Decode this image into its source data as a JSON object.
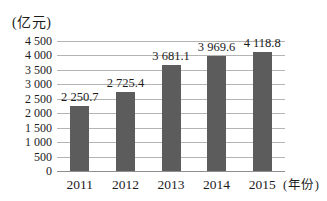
{
  "chart_data": {
    "type": "bar",
    "title": "",
    "unit_label": "(亿元)",
    "x_axis_label": "(年份)",
    "categories": [
      "2011",
      "2012",
      "2013",
      "2014",
      "2015"
    ],
    "values": [
      2250.7,
      2725.4,
      3681.1,
      3969.6,
      4118.8
    ],
    "value_labels": [
      "2 250.7",
      "2 725.4",
      "3 681.1",
      "3 969.6",
      "4 118.8"
    ],
    "y_ticks": [
      0,
      500,
      1000,
      1500,
      2000,
      2500,
      3000,
      3500,
      4000,
      4500
    ],
    "y_tick_labels": [
      "0",
      "500",
      "1 000",
      "1 500",
      "2 000",
      "2 500",
      "3 000",
      "3 500",
      "4 000",
      "4 500"
    ],
    "ylim": [
      0,
      4500
    ],
    "grid": true,
    "legend": "none",
    "bar_color": "#5c5c5c",
    "gridline_color": "#b4b4b4",
    "axis_color": "#8f8f8f",
    "text_color": "#1c1c1c",
    "background_color": "#ffffff"
  }
}
